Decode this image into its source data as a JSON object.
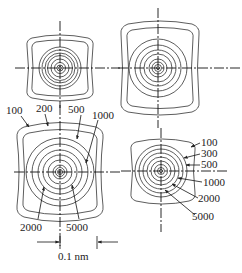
{
  "figure": {
    "line_color": "#333333",
    "background": "#ffffff"
  },
  "panels": [
    {
      "id": "top-left",
      "labels": []
    },
    {
      "id": "top-right",
      "labels": []
    },
    {
      "id": "bottom-left",
      "labels_top": [
        "100",
        "200",
        "500",
        "1000"
      ],
      "labels_bottom": [
        "2000",
        "5000"
      ],
      "scale_bar": "0.1 nm"
    },
    {
      "id": "bottom-right",
      "labels_right": [
        "100",
        "300",
        "500",
        "1000",
        "2000",
        "5000"
      ]
    }
  ]
}
